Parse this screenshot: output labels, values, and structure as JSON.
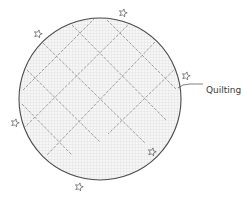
{
  "diagram": {
    "label": "Quilting",
    "colors": {
      "outline": "#4a4a4a",
      "fill_grid": "#d9d9d9",
      "fill_bg": "#f7f7f7",
      "quilt_lines": "#8a8a8a",
      "stars": "#555555",
      "label_text": "#3a3a3a"
    },
    "circle": {
      "cx": 100,
      "cy": 99,
      "r": 81
    },
    "stars": [
      {
        "x": 123,
        "y": 13
      },
      {
        "x": 38,
        "y": 34
      },
      {
        "x": 186,
        "y": 76
      },
      {
        "x": 15,
        "y": 123
      },
      {
        "x": 152,
        "y": 152
      },
      {
        "x": 79,
        "y": 187
      }
    ],
    "quilt_lines": [
      {
        "x1": 107,
        "y1": 20,
        "x2": 177,
        "y2": 90
      },
      {
        "x1": 72,
        "y1": 25,
        "x2": 167,
        "y2": 121
      },
      {
        "x1": 43,
        "y1": 43,
        "x2": 145,
        "y2": 143
      },
      {
        "x1": 27,
        "y1": 70,
        "x2": 100,
        "y2": 142
      },
      {
        "x1": 22,
        "y1": 104,
        "x2": 72,
        "y2": 155
      },
      {
        "x1": 95,
        "y1": 18,
        "x2": 23,
        "y2": 90
      },
      {
        "x1": 131,
        "y1": 22,
        "x2": 24,
        "y2": 128
      },
      {
        "x1": 155,
        "y1": 42,
        "x2": 47,
        "y2": 155
      },
      {
        "x1": 177,
        "y1": 67,
        "x2": 108,
        "y2": 134
      }
    ]
  }
}
